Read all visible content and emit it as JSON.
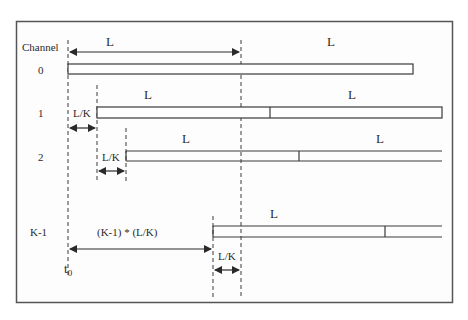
{
  "diagram": {
    "header_label": "Channel",
    "length_label": "L",
    "offset_label": "L/K",
    "cumulative_offset_label": "(K-1) * (L/K)",
    "time_origin": {
      "base": "t",
      "subscript": "0"
    },
    "channels": [
      {
        "label": "0",
        "segments": [
          "L",
          "L"
        ]
      },
      {
        "label": "1",
        "segments": [
          "L",
          "L"
        ],
        "offset": "L/K"
      },
      {
        "label": "2",
        "segments": [
          "L",
          "L"
        ],
        "offset": "L/K"
      },
      {
        "label": "K-1",
        "segments": [
          "L"
        ],
        "offset": "L/K"
      }
    ],
    "colors": {
      "frame": "#555555",
      "line": "#3a3a3a",
      "background": "#fdfdfd"
    }
  }
}
